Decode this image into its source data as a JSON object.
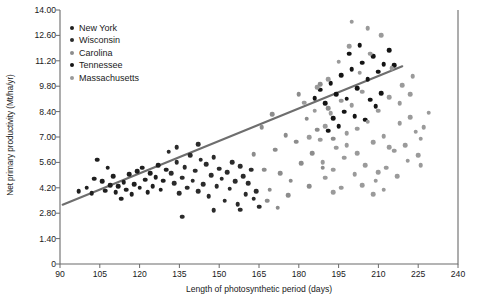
{
  "chart_data": {
    "type": "scatter",
    "title": "",
    "xlabel": "Length of photosynthetic period (days)",
    "ylabel": "Net primary productivity (Mt/ha/yr)",
    "xlim": [
      90,
      240
    ],
    "ylim": [
      0,
      14.0
    ],
    "xticks": [
      "90",
      "105",
      "120",
      "135",
      "150",
      "165",
      "180",
      "195",
      "210",
      "225",
      "240"
    ],
    "yticks": [
      "0",
      "1.40",
      "2.80",
      "4.20",
      "5.60",
      "7.00",
      "8.40",
      "9.80",
      "11.20",
      "12.60",
      "14.00"
    ],
    "grid": false,
    "legend_position": "top-left",
    "trendline": {
      "x0": 91,
      "y0": 3.27,
      "x1": 219,
      "y1": 10.9,
      "color": "#6e6e6e"
    },
    "series": [
      {
        "name": "New York",
        "color": "#1f1f1f",
        "points": [
          [
            104,
            5.75
          ],
          [
            106,
            4.55
          ],
          [
            107,
            4.05
          ],
          [
            109,
            4.35
          ],
          [
            110,
            4.85
          ],
          [
            111,
            3.95
          ],
          [
            112,
            4.3
          ],
          [
            113,
            3.6
          ],
          [
            114,
            4.5
          ],
          [
            115,
            4.1
          ],
          [
            116,
            4.95
          ],
          [
            117,
            3.85
          ],
          [
            118,
            4.4
          ],
          [
            119,
            5.1
          ],
          [
            120,
            4.2
          ],
          [
            121,
            5.3
          ],
          [
            122,
            4.65
          ],
          [
            123,
            3.95
          ],
          [
            124,
            5.0
          ],
          [
            125,
            4.3
          ],
          [
            126,
            4.8
          ],
          [
            127,
            5.45
          ],
          [
            128,
            4.1
          ],
          [
            129,
            4.6
          ],
          [
            130,
            5.2
          ],
          [
            97,
            4.0
          ],
          [
            100,
            4.2
          ],
          [
            102,
            3.9
          ],
          [
            108,
            5.3
          ],
          [
            103,
            4.7
          ]
        ]
      },
      {
        "name": "Wisconsin",
        "color": "#2b2b2b",
        "points": [
          [
            131,
            6.2
          ],
          [
            132,
            5.0
          ],
          [
            133,
            4.45
          ],
          [
            134,
            5.6
          ],
          [
            135,
            3.9
          ],
          [
            136,
            4.75
          ],
          [
            137,
            5.35
          ],
          [
            138,
            4.2
          ],
          [
            139,
            6.0
          ],
          [
            140,
            4.6
          ],
          [
            141,
            5.15
          ],
          [
            142,
            4.0
          ],
          [
            143,
            5.75
          ],
          [
            144,
            4.4
          ],
          [
            145,
            5.5
          ],
          [
            146,
            3.75
          ],
          [
            147,
            4.9
          ],
          [
            148,
            5.9
          ],
          [
            149,
            4.3
          ],
          [
            150,
            5.25
          ],
          [
            151,
            4.7
          ],
          [
            152,
            3.5
          ],
          [
            153,
            5.05
          ],
          [
            154,
            4.15
          ],
          [
            155,
            5.6
          ],
          [
            156,
            4.55
          ],
          [
            157,
            3.3
          ],
          [
            158,
            5.4
          ],
          [
            159,
            4.85
          ],
          [
            160,
            3.85
          ],
          [
            161,
            4.45
          ],
          [
            162,
            5.2
          ],
          [
            163,
            3.6
          ],
          [
            164,
            4.0
          ],
          [
            165,
            3.15
          ],
          [
            136,
            2.6
          ],
          [
            148,
            2.95
          ],
          [
            158,
            3.0
          ],
          [
            134,
            6.45
          ],
          [
            142,
            6.6
          ]
        ]
      },
      {
        "name": "Carolina",
        "color": "#8c8c8c",
        "points": [
          [
            167,
            5.2
          ],
          [
            169,
            4.1
          ],
          [
            171,
            6.3
          ],
          [
            173,
            5.0
          ],
          [
            175,
            7.1
          ],
          [
            177,
            4.6
          ],
          [
            179,
            6.75
          ],
          [
            181,
            5.55
          ],
          [
            183,
            8.0
          ],
          [
            185,
            6.1
          ],
          [
            187,
            7.4
          ],
          [
            189,
            5.3
          ],
          [
            191,
            8.6
          ],
          [
            193,
            6.9
          ],
          [
            168,
            3.5
          ],
          [
            172,
            3.1
          ],
          [
            176,
            3.8
          ],
          [
            180,
            9.35
          ],
          [
            184,
            4.3
          ],
          [
            188,
            9.9
          ],
          [
            163,
            6.05
          ],
          [
            166,
            7.55
          ],
          [
            170,
            8.25
          ]
        ]
      },
      {
        "name": "Tennessee",
        "color": "#141414",
        "points": [
          [
            186,
            9.15
          ],
          [
            188,
            9.6
          ],
          [
            190,
            8.85
          ],
          [
            192,
            9.95
          ],
          [
            194,
            9.35
          ],
          [
            196,
            10.4
          ],
          [
            198,
            9.1
          ],
          [
            200,
            10.75
          ],
          [
            202,
            9.7
          ],
          [
            204,
            11.1
          ],
          [
            206,
            10.2
          ],
          [
            208,
            11.45
          ],
          [
            210,
            10.6
          ],
          [
            212,
            11.0
          ],
          [
            214,
            11.8
          ],
          [
            197,
            8.4
          ],
          [
            201,
            8.15
          ],
          [
            205,
            7.95
          ],
          [
            209,
            8.7
          ],
          [
            193,
            8.05
          ],
          [
            199,
            11.6
          ],
          [
            203,
            12.05
          ],
          [
            216,
            10.95
          ],
          [
            211,
            9.4
          ],
          [
            207,
            9.05
          ],
          [
            195,
            7.6
          ],
          [
            191,
            7.35
          ]
        ]
      },
      {
        "name": "Massachusetts",
        "color": "#9a9a9a",
        "points": [
          [
            188,
            6.85
          ],
          [
            190,
            7.6
          ],
          [
            192,
            8.3
          ],
          [
            194,
            6.4
          ],
          [
            196,
            9.0
          ],
          [
            198,
            7.2
          ],
          [
            200,
            8.75
          ],
          [
            202,
            6.1
          ],
          [
            204,
            9.5
          ],
          [
            206,
            7.85
          ],
          [
            208,
            6.7
          ],
          [
            210,
            8.45
          ],
          [
            212,
            7.05
          ],
          [
            214,
            9.2
          ],
          [
            216,
            6.25
          ],
          [
            218,
            7.75
          ],
          [
            220,
            6.55
          ],
          [
            222,
            8.1
          ],
          [
            224,
            7.3
          ],
          [
            226,
            6.9
          ],
          [
            189,
            5.6
          ],
          [
            193,
            5.2
          ],
          [
            197,
            5.85
          ],
          [
            201,
            4.95
          ],
          [
            205,
            5.45
          ],
          [
            209,
            4.6
          ],
          [
            213,
            5.3
          ],
          [
            217,
            4.85
          ],
          [
            221,
            5.7
          ],
          [
            225,
            6.0
          ],
          [
            191,
            10.2
          ],
          [
            195,
            11.15
          ],
          [
            199,
            12.0
          ],
          [
            203,
            10.55
          ],
          [
            207,
            11.6
          ],
          [
            211,
            12.6
          ],
          [
            215,
            10.8
          ],
          [
            187,
            9.75
          ],
          [
            219,
            9.85
          ],
          [
            223,
            10.35
          ],
          [
            206,
            13.0
          ],
          [
            200,
            13.35
          ],
          [
            196,
            4.2
          ],
          [
            204,
            4.35
          ],
          [
            212,
            4.1
          ],
          [
            186,
            8.45
          ],
          [
            184,
            7.0
          ],
          [
            182,
            8.9
          ],
          [
            229,
            8.35
          ],
          [
            227,
            7.55
          ],
          [
            193,
            3.95
          ],
          [
            208,
            3.85
          ],
          [
            218,
            8.85
          ],
          [
            222,
            9.35
          ],
          [
            210,
            5.05
          ],
          [
            214,
            6.45
          ],
          [
            202,
            7.45
          ],
          [
            198,
            6.55
          ],
          [
            190,
            4.75
          ],
          [
            226,
            5.45
          ]
        ]
      }
    ]
  }
}
